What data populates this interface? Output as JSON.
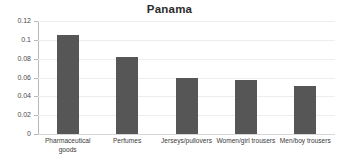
{
  "chart_data": {
    "type": "bar",
    "title": "Panama",
    "xlabel": "",
    "ylabel": "",
    "categories": [
      "Pharmaceutical goods",
      "Perfumes",
      "Jerseys/pullovers",
      "Women/girl trousers",
      "Men/boy trousers"
    ],
    "values": [
      0.105,
      0.082,
      0.059,
      0.057,
      0.051
    ],
    "ylim": [
      0,
      0.12
    ],
    "ytick_values": [
      0,
      0.02,
      0.04,
      0.06,
      0.08,
      0.1,
      0.12
    ],
    "ytick_labels": [
      "0",
      "0.02",
      "0.04",
      "0.06",
      "0.08",
      "0.1",
      "0.12"
    ],
    "grid": true,
    "legend": false,
    "legend_position": "none",
    "bar_color": "#565656",
    "gridline_color": "#ededed",
    "axis_color": "#b8b8b8",
    "title_color": "#2b2b2b",
    "background_color": "#ffffff"
  }
}
